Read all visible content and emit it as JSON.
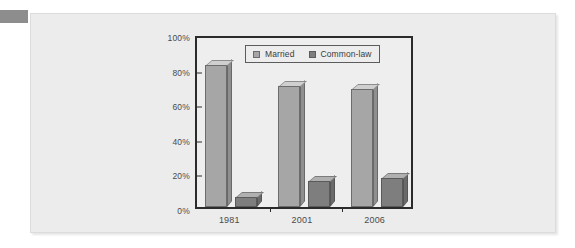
{
  "panel": {
    "background_color": "#ececec",
    "corner_tab_color": "#8d8d8d"
  },
  "chart_data": {
    "type": "bar",
    "title": "",
    "subtitle": "",
    "xlabel": "",
    "ylabel": "",
    "categories": [
      "1981",
      "2001",
      "2006"
    ],
    "series": [
      {
        "name": "Married",
        "values": [
          82,
          70,
          68
        ],
        "color": "#a6a6a6"
      },
      {
        "name": "Common-law",
        "values": [
          6,
          15,
          17
        ],
        "color": "#7e7e7e"
      }
    ],
    "ylim": [
      0,
      100
    ],
    "ytick_values": [
      0,
      20,
      40,
      60,
      80,
      100
    ],
    "ytick_labels": [
      "0%",
      "20%",
      "40%",
      "60%",
      "80%",
      "100%"
    ],
    "grid": false,
    "legend_position": "top-center",
    "value_suffix": "%",
    "style": "3d-column"
  },
  "legend": {
    "entries": [
      {
        "label": "Married",
        "swatch": "married-swatch"
      },
      {
        "label": "Common-law",
        "swatch": "common-law-swatch"
      }
    ]
  }
}
